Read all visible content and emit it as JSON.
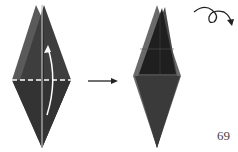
{
  "diagram": {
    "steps": [
      {
        "id": "step-fold",
        "action": "fold bottom flap up along horizontal crease",
        "arrow": "curved-fold-arrow",
        "crease": "dashed-valley-fold-line"
      },
      {
        "id": "step-result",
        "action": "turn model over",
        "symbol": "turn-over-icon"
      }
    ],
    "transition_arrow": "right-arrow",
    "page_number": "69",
    "colors": {
      "paper_dark": "#3a3a3a",
      "paper_darker": "#222222",
      "paper_edge": "#6a6a6a",
      "fold_line": "#ffffff"
    }
  }
}
